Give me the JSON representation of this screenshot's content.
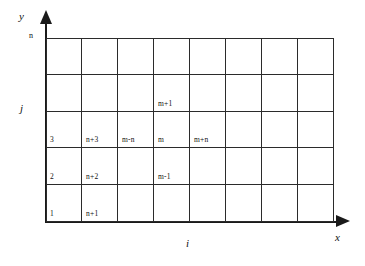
{
  "figure": {
    "line_color": "#2b2b2b",
    "axis_color": "#1a1a1a",
    "background": "#ffffff"
  },
  "axes": {
    "y_title": "y",
    "x_title": "x",
    "i_title": "i",
    "j_title": "j",
    "n_tick": "n"
  },
  "grid": {
    "columns": 8,
    "rows": 5,
    "cell_width": 36,
    "cell_height": 36.8,
    "left": 46,
    "top": 38
  },
  "cell_labels": [
    {
      "text": "m+1",
      "col": 4,
      "row": 2
    },
    {
      "text": "3",
      "col": 1,
      "row": 3
    },
    {
      "text": "n+3",
      "col": 2,
      "row": 3
    },
    {
      "text": "m-n",
      "col": 3,
      "row": 3
    },
    {
      "text": "m",
      "col": 4,
      "row": 3
    },
    {
      "text": "m+n",
      "col": 5,
      "row": 3
    },
    {
      "text": "2",
      "col": 1,
      "row": 4
    },
    {
      "text": "n+2",
      "col": 2,
      "row": 4
    },
    {
      "text": "m-1",
      "col": 4,
      "row": 4
    },
    {
      "text": "1",
      "col": 1,
      "row": 5
    },
    {
      "text": "n+1",
      "col": 2,
      "row": 5
    }
  ]
}
